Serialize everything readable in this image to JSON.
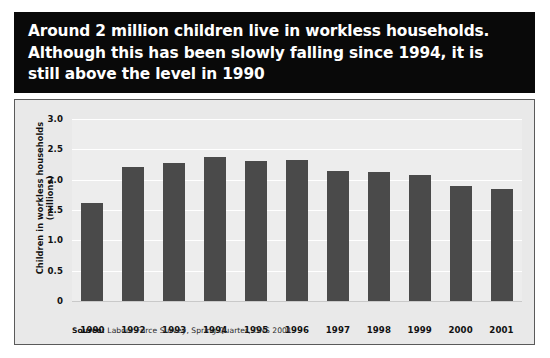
{
  "title": {
    "text": "Around 2 million children live in workless households.\nAlthough this has been slowly falling since 1994, it is\nstill above the level in 1990"
  },
  "source": {
    "label": "Source:",
    "text": " Labour Force Survey, Spring Quarter, ONS 2001"
  },
  "colors": {
    "banner_background": "#090909",
    "banner_text": "#ffffff",
    "panel_background": "#e9e9e9",
    "plot_background": "#ededed",
    "bar": "#4a4a4a",
    "gridline": "#ffffff",
    "axis_text": "#111111"
  },
  "chart_data": {
    "type": "bar",
    "title": "Around 2 million children live in workless households. Although this has been slowly falling since 1994, it is still above the level in 1990",
    "xlabel": "",
    "ylabel": "Children in workless households (millions)",
    "categories": [
      "1990",
      "1992",
      "1993",
      "1994",
      "1995",
      "1996",
      "1997",
      "1998",
      "1999",
      "2000",
      "2001"
    ],
    "values": [
      1.62,
      2.21,
      2.28,
      2.38,
      2.31,
      2.33,
      2.15,
      2.13,
      2.07,
      1.89,
      1.85
    ],
    "ylim": [
      0,
      3.0
    ],
    "yticks": [
      0,
      0.5,
      1.0,
      1.5,
      2.0,
      2.5,
      3.0
    ],
    "ytick_labels": [
      "0",
      "0.5",
      "1.0",
      "1.5",
      "2.0",
      "2.5",
      "3.0"
    ],
    "grid": true,
    "legend": false,
    "legend_position": "none",
    "series": [
      {
        "name": "Children in workless households (millions)",
        "values": [
          1.62,
          2.21,
          2.28,
          2.38,
          2.31,
          2.33,
          2.15,
          2.13,
          2.07,
          1.89,
          1.85
        ]
      }
    ]
  }
}
